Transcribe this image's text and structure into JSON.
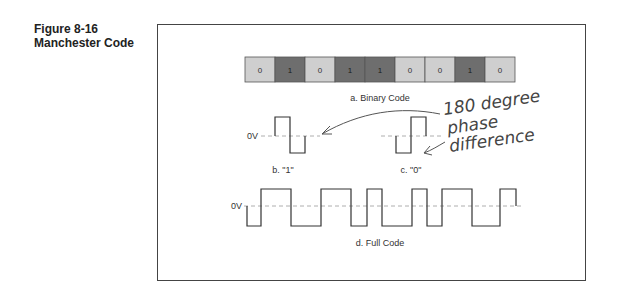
{
  "figure": {
    "number": "Figure 8-16",
    "title": "Manchester Code"
  },
  "binary_code": {
    "bits": [
      "0",
      "1",
      "0",
      "1",
      "1",
      "0",
      "0",
      "1",
      "0"
    ],
    "caption": "a. Binary Code",
    "colors": {
      "zero": "#cfcfcf",
      "one": "#6e6e6e",
      "zero_text": "#333333",
      "one_text": "#1a1a1a"
    }
  },
  "one_symbol": {
    "zero_label": "0V",
    "caption": "b. \"1\""
  },
  "zero_symbol": {
    "caption": "c. \"0\""
  },
  "full_code": {
    "zero_label": "0V",
    "caption": "d. Full Code"
  },
  "annotation": {
    "line1": "180 degree",
    "line2": "phase",
    "line3": "difference"
  }
}
